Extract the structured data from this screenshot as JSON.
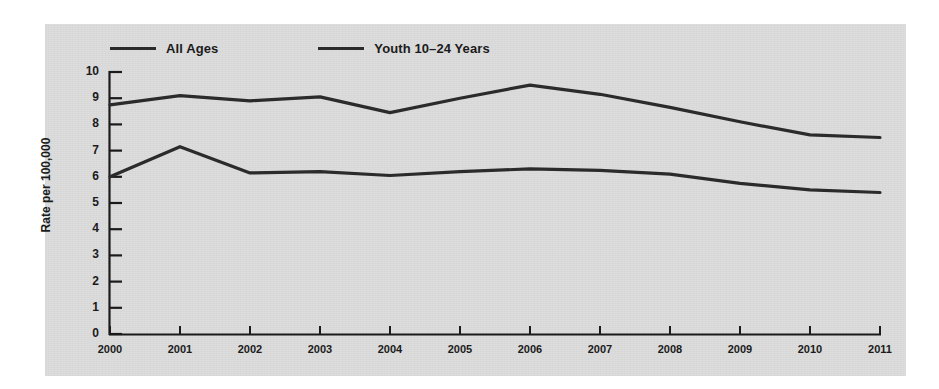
{
  "chart_data": {
    "type": "line",
    "title": "",
    "xlabel": "",
    "ylabel": "Rate per 100,000",
    "categories": [
      "2000",
      "2001",
      "2002",
      "2003",
      "2004",
      "2005",
      "2006",
      "2007",
      "2008",
      "2009",
      "2010",
      "2011"
    ],
    "x": [
      2000,
      2001,
      2002,
      2003,
      2004,
      2005,
      2006,
      2007,
      2008,
      2009,
      2010,
      2011
    ],
    "ylim": [
      0,
      10
    ],
    "xlim": [
      2000,
      2011
    ],
    "yticks": [
      "0",
      "1",
      "2",
      "3",
      "4",
      "5",
      "6",
      "7",
      "8",
      "9",
      "10"
    ],
    "ytick_values": [
      0,
      1,
      2,
      3,
      4,
      5,
      6,
      7,
      8,
      9,
      10
    ],
    "grid": false,
    "legend_position": "top-left",
    "series": [
      {
        "name": "All Ages",
        "color": "#2b2b2b",
        "values": [
          6.0,
          7.15,
          6.15,
          6.2,
          6.05,
          6.2,
          6.3,
          6.25,
          6.1,
          5.75,
          5.5,
          5.4
        ]
      },
      {
        "name": "Youth 10–24 Years",
        "color": "#2b2b2b",
        "values": [
          8.75,
          9.1,
          8.9,
          9.05,
          8.45,
          9.0,
          9.5,
          9.15,
          8.65,
          8.1,
          7.6,
          7.5
        ]
      }
    ]
  },
  "legend": {
    "items": [
      {
        "label": "All Ages"
      },
      {
        "label": "Youth 10–24 Years"
      }
    ]
  },
  "axes": {
    "y_title": "Rate per 100,000"
  },
  "colors": {
    "panel_background": "#dcdcdc",
    "figure_background": "#ffffff",
    "line": "#2b2b2b",
    "axis": "#1b1b1b",
    "text": "#1b1b1b"
  }
}
